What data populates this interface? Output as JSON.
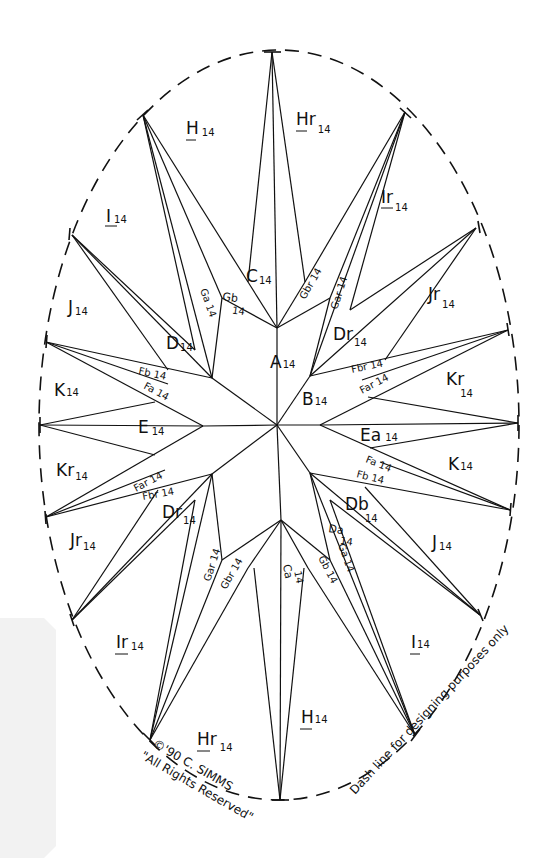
{
  "diagram": {
    "stroke_color": "#111111",
    "background": "#ffffff",
    "outline_style": "dashed oval"
  },
  "pieces": {
    "A": "A",
    "A_sub": "14",
    "B": "B",
    "B_sub": "14",
    "C": "C",
    "C_sub": "14",
    "Ca": "Ca",
    "Ca_sub": "14",
    "D": "D",
    "D_sub": "14",
    "Dr": "Dr",
    "Dr_sub": "14",
    "Dr2": "Dr",
    "Dr2_sub": "14",
    "Db": "Db",
    "Db_sub": "14",
    "Da": "Da",
    "Da_sub": "14",
    "E": "E",
    "E_sub": "14",
    "Ea": "Ea",
    "Ea_sub": "14",
    "Fb_left": "Fb 14",
    "Fa_left": "Fa 14",
    "Far_left": "Far 14",
    "Fbr_left": "Fbr 14",
    "Fbr_right": "Fbr 14",
    "Far_right": "Far 14",
    "Fa_right": "Fa 14",
    "Fb_right": "Fb 14",
    "Ga_top": "Ga 14",
    "Gb_top": "Gb",
    "Gb_top_sub": "14",
    "Gbr_top": "Gbr 14",
    "Gar_top": "Gar 14",
    "Gar_bottom": "Gar 14",
    "Gbr_bottom": "Gbr 14",
    "Gb_bottom": "Gb 14",
    "Ga_bottom": "Ga 14",
    "H_top": "H",
    "H_top_sub": "14",
    "Hr_top": "Hr",
    "Hr_top_sub": "14",
    "H_bottom": "H",
    "H_bottom_sub": "14",
    "Hr_bottom": "Hr",
    "Hr_bottom_sub": "14",
    "I_top": "I",
    "I_top_sub": "14",
    "Ir_top": "Ir",
    "Ir_top_sub": "14",
    "I_bottom": "I",
    "I_bottom_sub": "14",
    "Ir_bottom": "Ir",
    "Ir_bottom_sub": "14",
    "J_left": "J",
    "J_left_sub": "14",
    "Jr_right": "Jr",
    "Jr_right_sub": "14",
    "Jr_left": "Jr",
    "Jr_left_sub": "14",
    "J_right": "J",
    "J_right_sub": "14",
    "K_left": "K",
    "K_left_sub": "14",
    "Kr_left": "Kr",
    "Kr_left_sub": "14",
    "Kr_right": "Kr",
    "Kr_right_sub": "14",
    "K_right": "K",
    "K_right_sub": "14"
  },
  "annotations": {
    "copyright_line1": "©'90 C. SIMMS",
    "copyright_line2": "\"All Rights Reserved\"",
    "dash_note": "Dash line for designing purposes only"
  }
}
